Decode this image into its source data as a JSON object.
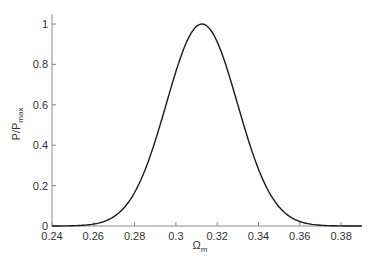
{
  "chart_data": {
    "type": "line",
    "title": "",
    "xlabel": "Ω",
    "xlabel_sub": "m",
    "ylabel": "P/P",
    "ylabel_sub": "max",
    "xlim": [
      0.24,
      0.39
    ],
    "ylim": [
      0,
      1.05
    ],
    "x_ticks": [
      "0.24",
      "0.26",
      "0.28",
      "0.3",
      "0.32",
      "0.34",
      "0.36",
      "0.38"
    ],
    "x_tick_values": [
      0.24,
      0.26,
      0.28,
      0.3,
      0.32,
      0.34,
      0.36,
      0.38
    ],
    "y_ticks": [
      "0",
      "0.2",
      "0.4",
      "0.6",
      "0.8",
      "1"
    ],
    "y_tick_values": [
      0,
      0.2,
      0.4,
      0.6,
      0.8,
      1.0
    ],
    "grid": false,
    "legend": null,
    "series": [
      {
        "name": "P/Pmax",
        "color": "#1a1a1a",
        "x": [
          0.24,
          0.25,
          0.26,
          0.27,
          0.28,
          0.29,
          0.3,
          0.305,
          0.31,
          0.3126,
          0.315,
          0.32,
          0.325,
          0.33,
          0.34,
          0.35,
          0.36,
          0.37,
          0.38,
          0.39
        ],
        "y": [
          0.0,
          0.01,
          0.04,
          0.13,
          0.27,
          0.48,
          0.73,
          0.86,
          0.97,
          1.0,
          0.99,
          0.92,
          0.8,
          0.64,
          0.34,
          0.13,
          0.04,
          0.01,
          0.0,
          0.0
        ]
      }
    ]
  },
  "colors": {
    "axis": "#888888",
    "line": "#1a1a1a",
    "text": "#333333"
  }
}
